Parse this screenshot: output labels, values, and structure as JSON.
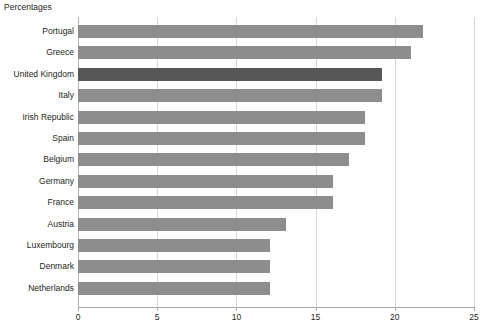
{
  "chart_data": {
    "type": "bar",
    "orientation": "horizontal",
    "title": "Percentages",
    "xlabel": "",
    "ylabel": "",
    "xlim": [
      0,
      25
    ],
    "xticks": [
      0,
      5,
      10,
      15,
      20,
      25
    ],
    "xtick_labels": [
      "0",
      "5",
      "10",
      "15",
      "20",
      "25"
    ],
    "grid": true,
    "legend": false,
    "colors": {
      "bar": "#8d8d8d",
      "bar_highlight": "#575757",
      "gridline": "#d6d6d6",
      "axis": "#a6a6a6",
      "text": "#231f20",
      "background": "#ffffff"
    },
    "highlight_category": "United Kingdom",
    "categories": [
      "Portugal",
      "Greece",
      "United Kingdom",
      "Italy",
      "Irish Republic",
      "Spain",
      "Belgium",
      "Germany",
      "France",
      "Austria",
      "Luxembourg",
      "Denmark",
      "Netherlands"
    ],
    "values": [
      21.8,
      21.0,
      19.2,
      19.2,
      18.1,
      18.1,
      17.1,
      16.1,
      16.1,
      13.1,
      12.1,
      12.1,
      12.1
    ]
  }
}
